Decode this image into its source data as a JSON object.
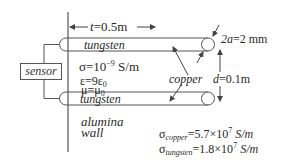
{
  "diagram": {
    "sensor_label": "sensor",
    "length_label": "t=0.5m",
    "length_var": "t",
    "length_value": "=0.5m",
    "diameter_var": "2a",
    "diameter_value": "=2 mm",
    "separation_var": "d",
    "separation_value": "=0.1m",
    "top_conductor_label": "tungsten",
    "bottom_conductor_label": "tungsten",
    "copper_label": "copper",
    "wall_label_line1": "alumina",
    "wall_label_line2": "wall",
    "wall_properties": {
      "sigma_prefix": "σ=10",
      "sigma_exp": "−9",
      "sigma_unit": " S/m",
      "epsilon_prefix": "ε=9ε",
      "epsilon_sub": "0",
      "mu_prefix": "μ=μ",
      "mu_sub": "0"
    },
    "conductivities": {
      "copper_symbol": "σ",
      "copper_sub": "copper",
      "copper_value": "=5.7×10",
      "copper_exp": "7",
      "copper_unit": " S/m",
      "tungsten_symbol": "σ",
      "tungsten_sub": "tungsten",
      "tungsten_value": "=1.8×10",
      "tungsten_exp": "7",
      "tungsten_unit": " S/m"
    },
    "colors": {
      "line": "#555555",
      "text": "#2a2a2a",
      "background": "#ffffff"
    }
  }
}
